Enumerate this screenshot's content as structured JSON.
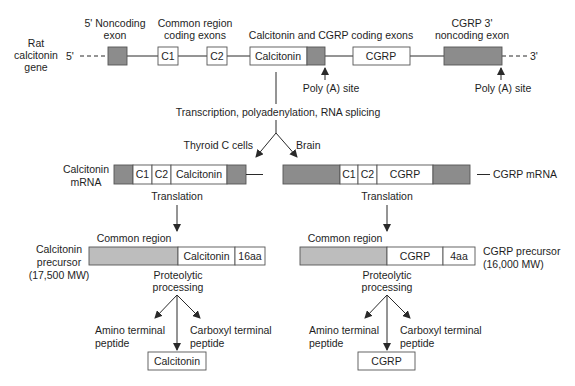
{
  "gene": {
    "label": [
      "Rat",
      "calcitonin",
      "gene"
    ],
    "five_prime": "5'",
    "three_prime": "3'",
    "headers": {
      "noncoding_5": [
        "5' Noncoding",
        "exon"
      ],
      "common_region": [
        "Common region",
        "coding exons"
      ],
      "calc_cgrp_coding": "Calcitonin and CGRP coding exons",
      "cgrp_3_noncoding": [
        "CGRP 3'",
        "noncoding exon"
      ]
    },
    "exons": {
      "c1": "C1",
      "c2": "C2",
      "calcitonin": "Calcitonin",
      "cgrp": "CGRP"
    },
    "poly_a_site_1": "Poly (A) site",
    "poly_a_site_2": "Poly (A) site"
  },
  "processing": {
    "step": "Transcription, polyadenylation, RNA splicing",
    "branch_left": "Thyroid C cells",
    "branch_right": "Brain"
  },
  "calcitonin_path": {
    "mrna_label": [
      "Calcitonin",
      "mRNA"
    ],
    "mrna_segments": {
      "c1": "C1",
      "c2": "C2",
      "main": "Calcitonin"
    },
    "translation": "Translation",
    "common_region": "Common region",
    "precursor_label": [
      "Calcitonin",
      "precursor",
      "(17,500 MW)"
    ],
    "precursor_segments": {
      "main": "Calcitonin",
      "tail": "16aa"
    },
    "proteolytic": [
      "Proteolytic",
      "processing"
    ],
    "amino_terminal": [
      "Amino terminal",
      "peptide"
    ],
    "carboxyl_terminal": [
      "Carboxyl terminal",
      "peptide"
    ],
    "product": "Calcitonin"
  },
  "cgrp_path": {
    "mrna_label": "CGRP mRNA",
    "mrna_segments": {
      "c1": "C1",
      "c2": "C2",
      "main": "CGRP"
    },
    "translation": "Translation",
    "common_region": "Common region",
    "precursor_label": [
      "CGRP precursor",
      "(16,000 MW)"
    ],
    "precursor_segments": {
      "main": "CGRP",
      "tail": "4aa"
    },
    "proteolytic": [
      "Proteolytic",
      "processing"
    ],
    "amino_terminal": [
      "Amino terminal",
      "peptide"
    ],
    "carboxyl_terminal": [
      "Carboxyl terminal",
      "peptide"
    ],
    "product": "CGRP"
  },
  "colors": {
    "noncoding_exon": "#8c8c8c",
    "common_region_fill": "#bdbdbd",
    "coding_exon": "#ffffff",
    "line": "#2a2a2a"
  }
}
